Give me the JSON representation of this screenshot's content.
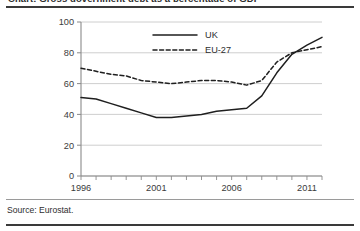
{
  "figure": {
    "title_sliver": "Chart: Gross government debt as a percentage of GDP",
    "source_note": "Source: Eurostat."
  },
  "chart_data": {
    "type": "line",
    "title": "",
    "xlabel": "",
    "ylabel": "",
    "xlim": [
      1996,
      2012
    ],
    "ylim": [
      0,
      100
    ],
    "grid": "horizontal",
    "legend_position": "top-center",
    "y_ticks": [
      0,
      20,
      40,
      60,
      80,
      100
    ],
    "y_tick_labels": [
      "0",
      "20",
      "40",
      "60",
      "80",
      "100"
    ],
    "x_ticks": [
      1996,
      1997,
      1998,
      1999,
      2000,
      2001,
      2002,
      2003,
      2004,
      2005,
      2006,
      2007,
      2008,
      2009,
      2010,
      2011,
      2012
    ],
    "x_tick_labels": [
      "1996",
      "",
      "",
      "",
      "",
      "2001",
      "",
      "",
      "",
      "",
      "2006",
      "",
      "",
      "",
      "",
      "2011",
      ""
    ],
    "x": [
      1996,
      1997,
      1998,
      1999,
      2000,
      2001,
      2002,
      2003,
      2004,
      2005,
      2006,
      2007,
      2008,
      2009,
      2010,
      2011,
      2012
    ],
    "series": [
      {
        "name": "UK",
        "style": "solid",
        "color": "#1f1f1f",
        "values": [
          51,
          50,
          47,
          44,
          41,
          38,
          38,
          39,
          40,
          42,
          43,
          44,
          52,
          67,
          79,
          85,
          90
        ]
      },
      {
        "name": "EU-27",
        "style": "dashed",
        "color": "#1f1f1f",
        "values": [
          70,
          68,
          66,
          65,
          62,
          61,
          60,
          61,
          62,
          62,
          61,
          59,
          62,
          74,
          80,
          82,
          84
        ]
      }
    ]
  }
}
